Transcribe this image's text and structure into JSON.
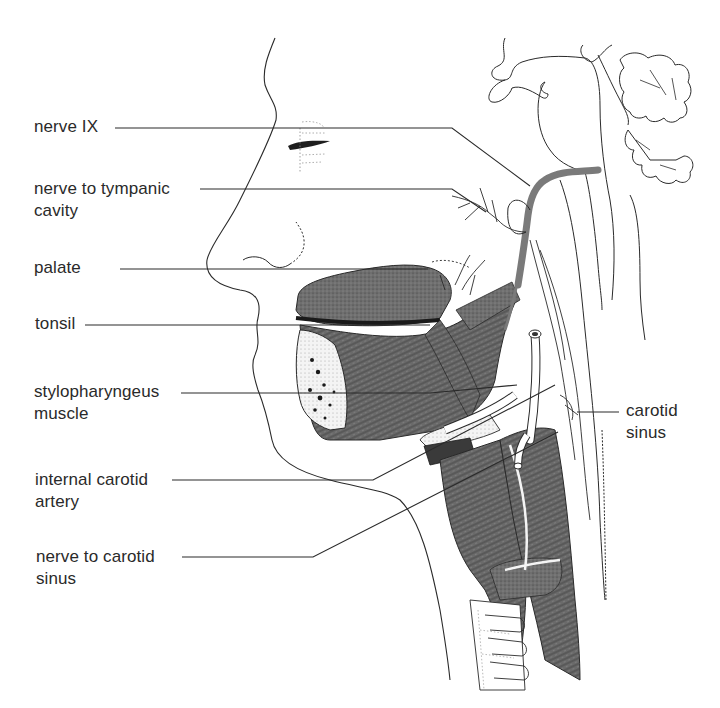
{
  "figure": {
    "colors": {
      "line": "#2a2a2a",
      "muscle": "#6b6b6b",
      "muscle_dark": "#4a4a4a",
      "nerve": "#7a7a7a",
      "background": "#ffffff"
    }
  },
  "labels": [
    {
      "id": "nerve-ix",
      "lines": [
        "nerve  IX"
      ],
      "side": "left"
    },
    {
      "id": "nerve-to-tympanic-cavity",
      "lines": [
        "nerve to tympanic",
        "cavity"
      ],
      "side": "left"
    },
    {
      "id": "palate",
      "lines": [
        "palate"
      ],
      "side": "left"
    },
    {
      "id": "tonsil",
      "lines": [
        "tonsil"
      ],
      "side": "left"
    },
    {
      "id": "stylopharyngeus-muscle",
      "lines": [
        "stylopharyngeus",
        "muscle"
      ],
      "side": "left"
    },
    {
      "id": "internal-carotid-artery",
      "lines": [
        "internal carotid",
        "artery"
      ],
      "side": "left"
    },
    {
      "id": "nerve-to-carotid-sinus",
      "lines": [
        "nerve to carotid",
        "sinus"
      ],
      "side": "left"
    },
    {
      "id": "carotid-sinus",
      "lines": [
        "carotid",
        "sinus"
      ],
      "side": "right"
    }
  ]
}
